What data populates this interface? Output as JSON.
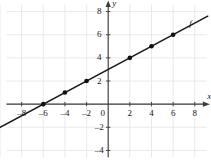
{
  "chart_data": {
    "type": "line",
    "title": "",
    "subtitle": "",
    "xlabel": "x",
    "ylabel": "y",
    "xlim": [
      -10,
      9.5
    ],
    "ylim": [
      -5,
      9
    ],
    "grid": true,
    "grid_step": 2,
    "legend": "none",
    "xticks": [
      -8,
      -6,
      -4,
      -2,
      0,
      2,
      4,
      6,
      8
    ],
    "xtick_labels": [
      "–8",
      "–6",
      "–4",
      "–2",
      "0",
      "2",
      "4",
      "6",
      "8"
    ],
    "yticks": [
      -4,
      -2,
      2,
      4,
      6,
      8
    ],
    "ytick_labels": [
      "–4",
      "–2",
      "2",
      "4",
      "6",
      "8"
    ],
    "origin_label": "0",
    "series": [
      {
        "name": "f",
        "annotation": "f",
        "annotation_x": 7.6,
        "annotation_y": 7.0,
        "slope": 0.5,
        "intercept": 3,
        "equation": "f(x) = 0.5x + 3",
        "line_x": [
          -10.2,
          9.2
        ],
        "line_y": [
          -2.1,
          7.6
        ],
        "points": [
          {
            "x": -6,
            "y": 0
          },
          {
            "x": -4,
            "y": 1
          },
          {
            "x": -2,
            "y": 2
          },
          {
            "x": 2,
            "y": 4
          },
          {
            "x": 4,
            "y": 5
          },
          {
            "x": 6,
            "y": 6
          }
        ]
      }
    ],
    "colors": {
      "background": "#ffffff",
      "grid": "#e8e8e8",
      "axis": "#3a3a3a",
      "line": "#1a1a1a",
      "marker": "#111111",
      "text": "#1a1a1a"
    }
  }
}
